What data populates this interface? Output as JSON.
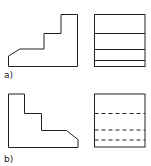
{
  "figure": {
    "panels": [
      {
        "label": "a)",
        "front_view": "stepped profile with chamfer at lower-left",
        "side_view": "rectangle with solid horizontal lines",
        "side_line_style": "solid"
      },
      {
        "label": "b)",
        "front_view": "stepped profile with chamfer at lower-right",
        "side_view": "rectangle with dashed horizontal lines",
        "side_line_style": "hidden (dashed)"
      }
    ],
    "colors": {
      "line": "#222222",
      "background": "#ffffff"
    }
  }
}
